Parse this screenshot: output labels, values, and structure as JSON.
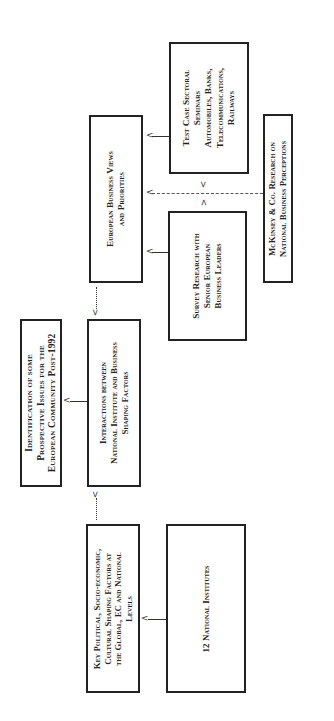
{
  "diagram": {
    "orientation": "rotated-90-ccw",
    "boxes": {
      "identification": {
        "lines": [
          "Identification of some",
          "Prospective Issues for the",
          "European Community Post-1992"
        ]
      },
      "interactions": {
        "lines": [
          "Interactions between",
          "National Institute and Business",
          "Shaping Factors"
        ]
      },
      "key_factors": {
        "lines": [
          "Key Political, Socio-economic,",
          "Cultural Shaping Factors at",
          "the Global, EC and National",
          "Levels"
        ]
      },
      "national_institutes": {
        "lines": [
          "12 National Institutes"
        ]
      },
      "european_views": {
        "lines": [
          "European Business Views",
          "and Priorities"
        ]
      },
      "test_case": {
        "lines": [
          "Test Case Sectoral",
          "Seminars",
          "Automobiles, Banks,",
          "Telecommunications,",
          "Railways"
        ]
      },
      "survey": {
        "lines": [
          "Survey Research with",
          "Senior European",
          "Business Leaders"
        ]
      },
      "mckinsey": {
        "lines": [
          "McKinsey & Co. Research on",
          "National Business Perceptions"
        ]
      }
    },
    "connectors": [
      {
        "from": "interactions",
        "to": "identification",
        "style": "solid"
      },
      {
        "from": "national_institutes",
        "to": "key_factors",
        "style": "solid"
      },
      {
        "from": "key_factors",
        "to": "interactions",
        "style": "dotted"
      },
      {
        "from": "european_views",
        "to": "interactions",
        "style": "dotted"
      },
      {
        "from": "test_case",
        "to": "european_views",
        "style": "solid"
      },
      {
        "from": "survey",
        "to": "european_views",
        "style": "solid"
      },
      {
        "from": "mckinsey",
        "to": "european_views",
        "style": "dashed"
      },
      {
        "from": "mckinsey",
        "to": "test_case/survey",
        "style": "dashed-bidirectional"
      }
    ],
    "arrow_glyphs": {
      "left": "<",
      "up": "^",
      "down": "v",
      "dashed_double": "<->"
    }
  }
}
